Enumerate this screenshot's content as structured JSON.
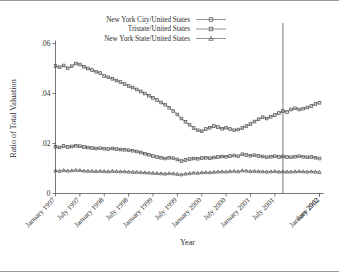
{
  "figure": {
    "background": "#ffffff",
    "frame_color": "#555555"
  },
  "legend": {
    "position": "top-center",
    "entries": [
      {
        "label": "New York City/United States",
        "marker": "square",
        "color": "#4a4a4a"
      },
      {
        "label": "Tristate/United States",
        "marker": "square",
        "color": "#4a4a4a"
      },
      {
        "label": "New York State/United States",
        "marker": "triangle",
        "color": "#4a4a4a"
      }
    ]
  },
  "annotations": {
    "vertical_rule": {
      "name": "september-2001-reference-line",
      "x_label": "September 2001",
      "color": "#555555"
    }
  },
  "chart_data": {
    "type": "line",
    "title": "",
    "xlabel": "Year",
    "ylabel": "Ratio of Total Valuation",
    "grid": false,
    "legend_position": "top-center",
    "ylim": [
      0,
      0.06
    ],
    "yticks": [
      0,
      0.02,
      0.04,
      0.06
    ],
    "ytick_labels": [
      "0",
      ".02",
      ".04",
      ".06"
    ],
    "xticks": [
      0,
      6,
      12,
      18,
      24,
      30,
      36,
      42,
      48,
      54,
      65
    ],
    "xtick_labels": [
      "January 1997",
      "July 1997",
      "January 1998",
      "July 1998",
      "January 1999",
      "July 1999",
      "January 2000",
      "July 2000",
      "January 2001",
      "July 2001",
      "January 2002",
      "June 2002"
    ],
    "x_index_start": 0,
    "x_index_end": 65,
    "vline_x": 56,
    "series": [
      {
        "name": "New York City/United States",
        "marker": "square",
        "color": "#4a4a4a",
        "values": [
          0.051,
          0.0505,
          0.0512,
          0.0501,
          0.0509,
          0.052,
          0.0516,
          0.0507,
          0.05,
          0.0494,
          0.0487,
          0.0482,
          0.047,
          0.0465,
          0.0459,
          0.0452,
          0.0446,
          0.0438,
          0.043,
          0.0424,
          0.0416,
          0.0408,
          0.04,
          0.0391,
          0.0383,
          0.0374,
          0.0364,
          0.0355,
          0.0343,
          0.033,
          0.0316,
          0.03,
          0.0287,
          0.0275,
          0.0262,
          0.0253,
          0.0249,
          0.0258,
          0.0263,
          0.027,
          0.0266,
          0.0259,
          0.0263,
          0.0258,
          0.0253,
          0.0256,
          0.0262,
          0.027,
          0.0278,
          0.0288,
          0.0297,
          0.0305,
          0.03,
          0.0307,
          0.0314,
          0.0322,
          0.033,
          0.0326,
          0.0336,
          0.0341,
          0.0336,
          0.0339,
          0.0344,
          0.035,
          0.0358,
          0.0363
        ]
      },
      {
        "name": "Tristate/United States",
        "marker": "square",
        "color": "#4a4a4a",
        "values": [
          0.0187,
          0.0184,
          0.019,
          0.0186,
          0.0188,
          0.0191,
          0.0189,
          0.0186,
          0.0184,
          0.0182,
          0.018,
          0.0181,
          0.0179,
          0.0178,
          0.018,
          0.0178,
          0.0176,
          0.0175,
          0.0173,
          0.0171,
          0.0168,
          0.0164,
          0.0159,
          0.0155,
          0.015,
          0.0146,
          0.0143,
          0.014,
          0.0143,
          0.0141,
          0.0136,
          0.013,
          0.0134,
          0.0138,
          0.014,
          0.0139,
          0.0142,
          0.0143,
          0.0141,
          0.0144,
          0.0146,
          0.0148,
          0.0147,
          0.015,
          0.0152,
          0.0149,
          0.0157,
          0.0154,
          0.0151,
          0.0153,
          0.015,
          0.0148,
          0.0145,
          0.0147,
          0.0149,
          0.0146,
          0.0148,
          0.0146,
          0.0145,
          0.0147,
          0.0149,
          0.0147,
          0.0145,
          0.0146,
          0.0143,
          0.014
        ]
      },
      {
        "name": "New York State/United States",
        "marker": "triangle",
        "color": "#4a4a4a",
        "values": [
          0.0092,
          0.009,
          0.0093,
          0.0091,
          0.0092,
          0.0094,
          0.0093,
          0.0091,
          0.009,
          0.009,
          0.0089,
          0.009,
          0.0089,
          0.0088,
          0.009,
          0.0089,
          0.0088,
          0.0088,
          0.0087,
          0.0086,
          0.0086,
          0.0085,
          0.0084,
          0.0083,
          0.0082,
          0.0081,
          0.008,
          0.0079,
          0.0081,
          0.008,
          0.0078,
          0.0076,
          0.0079,
          0.0081,
          0.0083,
          0.0082,
          0.0084,
          0.0085,
          0.0084,
          0.0086,
          0.0087,
          0.0088,
          0.0087,
          0.0089,
          0.009,
          0.0088,
          0.0092,
          0.0091,
          0.0089,
          0.009,
          0.0089,
          0.0088,
          0.0087,
          0.0088,
          0.0089,
          0.0087,
          0.0088,
          0.0087,
          0.0087,
          0.0088,
          0.0089,
          0.0088,
          0.0087,
          0.0088,
          0.0087,
          0.0086
        ]
      }
    ]
  }
}
